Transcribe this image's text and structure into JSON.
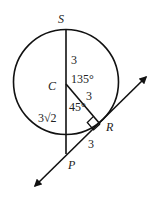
{
  "diagram": {
    "points": {
      "S": {
        "label": "S"
      },
      "C": {
        "label": "C"
      },
      "R": {
        "label": "R"
      },
      "P": {
        "label": "P"
      }
    },
    "segment_labels": {
      "SC": "3",
      "CR": "3",
      "RP": "3",
      "CP": "3√2"
    },
    "angle_labels": {
      "SCR": "135°",
      "RCP": "45°"
    },
    "colors": {
      "stroke": "#111111",
      "text": "#222222"
    }
  }
}
